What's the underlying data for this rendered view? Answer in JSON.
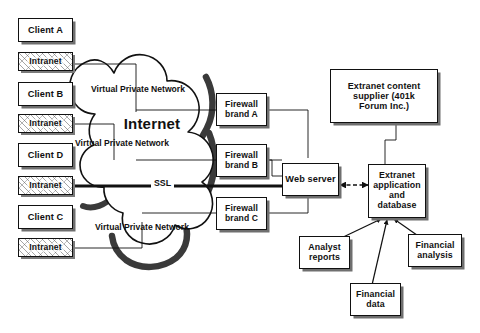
{
  "diagram": {
    "colors": {
      "stroke": "#111111",
      "shadow": "#6f6f6f",
      "background": "#ffffff",
      "cloud_shadow": "#3a3a3a"
    },
    "clients": [
      {
        "id": "client-a",
        "label": "Client A"
      },
      {
        "id": "client-b",
        "label": "Client B"
      },
      {
        "id": "client-d",
        "label": "Client D"
      },
      {
        "id": "client-c",
        "label": "Client C"
      }
    ],
    "intranets": [
      {
        "id": "intranet-a",
        "label": "Intranet"
      },
      {
        "id": "intranet-b",
        "label": "Intranet"
      },
      {
        "id": "intranet-d",
        "label": "Intranet"
      },
      {
        "id": "intranet-c",
        "label": "Intranet"
      }
    ],
    "cloud": {
      "internet_label": "Internet",
      "vpn_labels": [
        "Virtual Private Network",
        "Virtual Private Network",
        "Virtual Private Network"
      ],
      "ssl_label": "SSL"
    },
    "firewalls": [
      {
        "id": "firewall-a",
        "label": "Firewall\nbrand A"
      },
      {
        "id": "firewall-b",
        "label": "Firewall\nbrand B"
      },
      {
        "id": "firewall-c",
        "label": "Firewall\nbrand C"
      }
    ],
    "web_server": {
      "id": "web-server",
      "label": "Web server"
    },
    "content_supplier": {
      "id": "extranet-content-supplier",
      "label": "Extranet content\nsupplier (401k\nForum Inc.)"
    },
    "extranet_application": {
      "id": "extranet-application-and-database",
      "label": "Extranet\napplication\nand\ndatabase"
    },
    "data_sources": [
      {
        "id": "analyst-reports",
        "label": "Analyst\nreports"
      },
      {
        "id": "financial-data",
        "label": "Financial\ndata"
      },
      {
        "id": "financial-analysis",
        "label": "Financial\nanalysis"
      }
    ]
  }
}
